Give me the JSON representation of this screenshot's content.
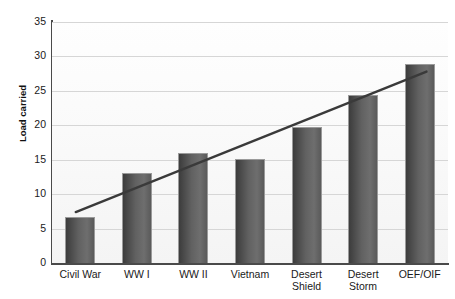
{
  "chart_data": {
    "type": "bar",
    "title": "",
    "subtitle": "",
    "xlabel": "",
    "ylabel": "Load carried",
    "categories": [
      "Civil War",
      "WW I",
      "WW II",
      "Vietnam",
      "Desert Shield",
      "Desert Storm",
      "OEF/OIF"
    ],
    "category_labels_wrapped": [
      "Civil War",
      "WW I",
      "WW II",
      "Vietnam",
      "Desert\nShield",
      "Desert\nStorm",
      "OEF/OIF"
    ],
    "values": [
      6.7,
      13.1,
      16.0,
      15.1,
      19.7,
      24.4,
      28.9
    ],
    "series": [
      {
        "name": "Load carried",
        "values": [
          6.7,
          13.1,
          16.0,
          15.1,
          19.7,
          24.4,
          28.9
        ]
      }
    ],
    "ylim": [
      0,
      35
    ],
    "xlim": [
      0,
      7
    ],
    "y_ticks": [
      0,
      5,
      10,
      15,
      20,
      25,
      30,
      35
    ],
    "y_tick_labels": [
      "0",
      "5",
      "10",
      "15",
      "20",
      "25",
      "30",
      "35"
    ],
    "grid": true,
    "grid_axis": "y",
    "legend": false,
    "legend_position": "none",
    "bar_color": "#5c5c5c",
    "grid_color": "#d6d6d6",
    "axis_color": "#4a4a4a",
    "trendline": {
      "type": "line",
      "name": "trend",
      "color": "#3a3a3a",
      "x_start": 0.42,
      "y_start": 7.4,
      "x_end": 6.62,
      "y_end": 27.8
    },
    "annotations": []
  }
}
